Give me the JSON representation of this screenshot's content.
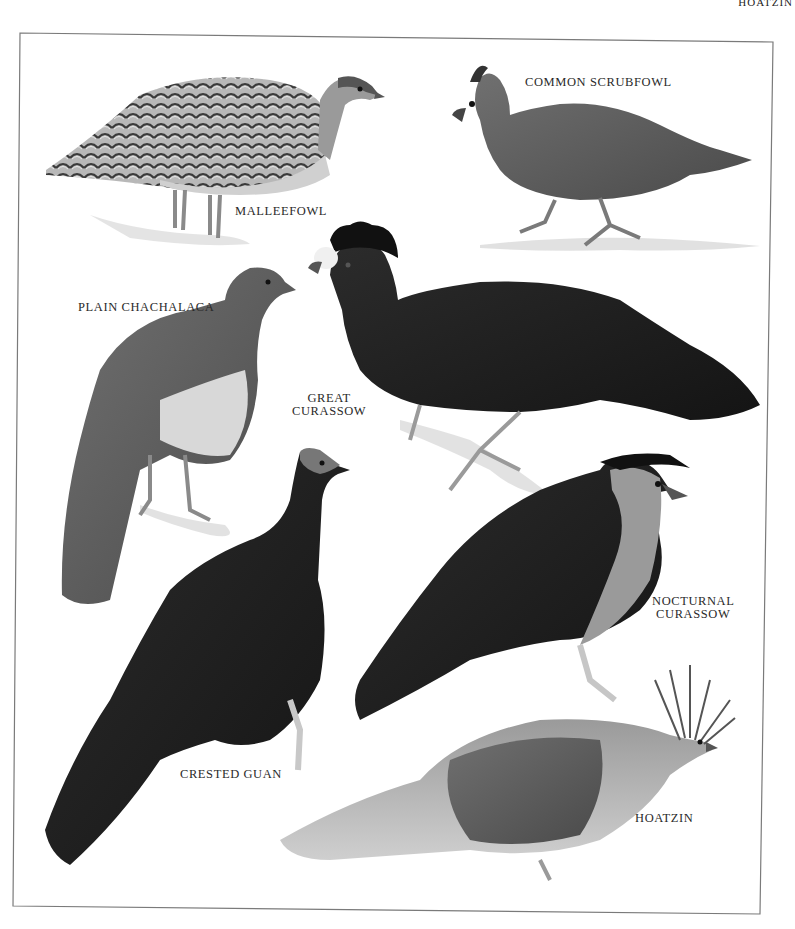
{
  "page": {
    "running_head": "HOATZIN",
    "colors": {
      "background": "#ffffff",
      "frame": "#7a7a7a",
      "label_text": "#2a2a2a",
      "dark_plumage": "#1c1c1c",
      "mid_plumage": "#5a5a5a",
      "light_plumage": "#a8a8a8"
    }
  },
  "plate": {
    "labels": {
      "malleefowl": "MALLEEFOWL",
      "common_scrubfowl": "COMMON SCRUBFOWL",
      "plain_chachalaca": "PLAIN CHACHALACA",
      "great_curassow_1": "GREAT",
      "great_curassow_2": "CURASSOW",
      "nocturnal_curassow_1": "NOCTURNAL",
      "nocturnal_curassow_2": "CURASSOW",
      "crested_guan": "CRESTED GUAN",
      "hoatzin": "HOATZIN"
    }
  }
}
